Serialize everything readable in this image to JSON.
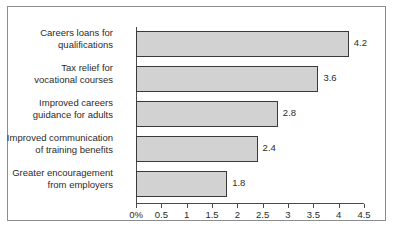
{
  "chart_data": {
    "type": "bar",
    "orientation": "horizontal",
    "title": "",
    "subtitle": "",
    "xlabel": "",
    "ylabel": "",
    "categories": [
      "Careers loans for\nqualifications",
      "Tax relief for\nvocational courses",
      "Improved careers\nguidance for adults",
      "Improved communication\nof training benefits",
      "Greater encouragement\nfrom employers"
    ],
    "values": [
      4.2,
      3.6,
      2.8,
      2.4,
      1.8
    ],
    "value_labels": [
      "4.2",
      "3.6",
      "2.8",
      "2.4",
      "1.8"
    ],
    "xlim": [
      0,
      4.5
    ],
    "xticks": [
      0,
      0.5,
      1,
      1.5,
      2,
      2.5,
      3,
      3.5,
      4,
      4.5
    ],
    "xtick_labels": [
      "0%",
      "0.5",
      "1",
      "1.5",
      "2",
      "2.5",
      "3",
      "3.5",
      "4",
      "4.5"
    ],
    "grid": false,
    "legend": false,
    "legend_position": "none",
    "colors": {
      "bar_fill": "#d2d2d2",
      "bar_border": "#3a3a3a",
      "axis": "#4a4a4a",
      "text": "#2b2b2b",
      "frame": "#8d8d8d",
      "background": "#ffffff"
    }
  }
}
